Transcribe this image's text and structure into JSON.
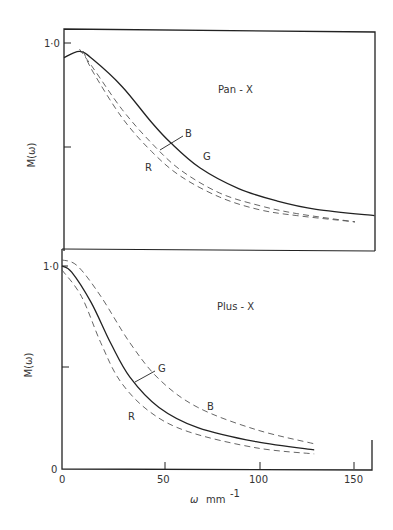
{
  "chart_data": [
    {
      "type": "line",
      "title": "Pan - X",
      "xlabel": "ω mm⁻¹",
      "ylabel": "M(ω)",
      "xlim": [
        0,
        160
      ],
      "ylim": [
        0,
        1.0
      ],
      "yticks": [
        "1·0"
      ],
      "ytick_values": [
        1.0,
        0.5
      ],
      "grid": false,
      "legend": "inline labels",
      "series": [
        {
          "name": "G",
          "style": "solid",
          "x": [
            0,
            8,
            15,
            30,
            45,
            55,
            70,
            90,
            110,
            130,
            160
          ],
          "y": [
            0.93,
            0.96,
            0.92,
            0.79,
            0.62,
            0.52,
            0.4,
            0.3,
            0.24,
            0.2,
            0.17
          ]
        },
        {
          "name": "B",
          "style": "dashed",
          "x": [
            8,
            15,
            30,
            45,
            60,
            80,
            100,
            120,
            150
          ],
          "y": [
            0.97,
            0.88,
            0.68,
            0.52,
            0.39,
            0.28,
            0.22,
            0.18,
            0.14
          ]
        },
        {
          "name": "R",
          "style": "dashed",
          "x": [
            10,
            15,
            30,
            45,
            60,
            80,
            100,
            120,
            150
          ],
          "y": [
            0.96,
            0.86,
            0.64,
            0.48,
            0.36,
            0.26,
            0.2,
            0.17,
            0.14
          ]
        }
      ],
      "annotations": [
        "Pan - X",
        "B",
        "G",
        "R"
      ]
    },
    {
      "type": "line",
      "title": "Plus - X",
      "xlabel": "ω mm⁻¹",
      "ylabel": "M(ω)",
      "xlim": [
        0,
        160
      ],
      "ylim": [
        0,
        1.0
      ],
      "xticks": [
        "0",
        "50",
        "100",
        "150"
      ],
      "yticks": [
        "1·0",
        "0"
      ],
      "grid": false,
      "legend": "inline labels",
      "series": [
        {
          "name": "G",
          "style": "solid",
          "x": [
            0,
            5,
            15,
            25,
            35,
            50,
            70,
            100,
            130
          ],
          "y": [
            1.0,
            0.97,
            0.82,
            0.62,
            0.45,
            0.3,
            0.2,
            0.13,
            0.09
          ]
        },
        {
          "name": "B",
          "style": "dashed",
          "x": [
            0,
            8,
            20,
            35,
            50,
            70,
            100,
            130
          ],
          "y": [
            1.03,
            1.0,
            0.85,
            0.62,
            0.44,
            0.3,
            0.19,
            0.12
          ]
        },
        {
          "name": "R",
          "style": "dashed",
          "x": [
            0,
            10,
            20,
            30,
            45,
            65,
            100,
            130
          ],
          "y": [
            0.98,
            0.85,
            0.62,
            0.43,
            0.28,
            0.18,
            0.1,
            0.07
          ]
        }
      ],
      "annotations": [
        "Plus - X",
        "G",
        "B",
        "R"
      ]
    }
  ],
  "labels": {
    "top_title": "Pan - X",
    "bottom_title": "Plus - X",
    "ylabel": "M(ω)",
    "xlabel_omega": "ω",
    "xlabel_unit": "mm",
    "xlabel_exp": "-1",
    "ytick_top_1": "1·0",
    "ytick_bottom_1": "1·0",
    "ytick_bottom_0": "0",
    "xticks": [
      "0",
      "50",
      "100",
      "150"
    ],
    "top_B": "B",
    "top_G": "G",
    "top_R": "R",
    "bot_G": "G",
    "bot_B": "B",
    "bot_R": "R"
  },
  "colors": {
    "ink": "#222222",
    "dashed": "#555555"
  }
}
